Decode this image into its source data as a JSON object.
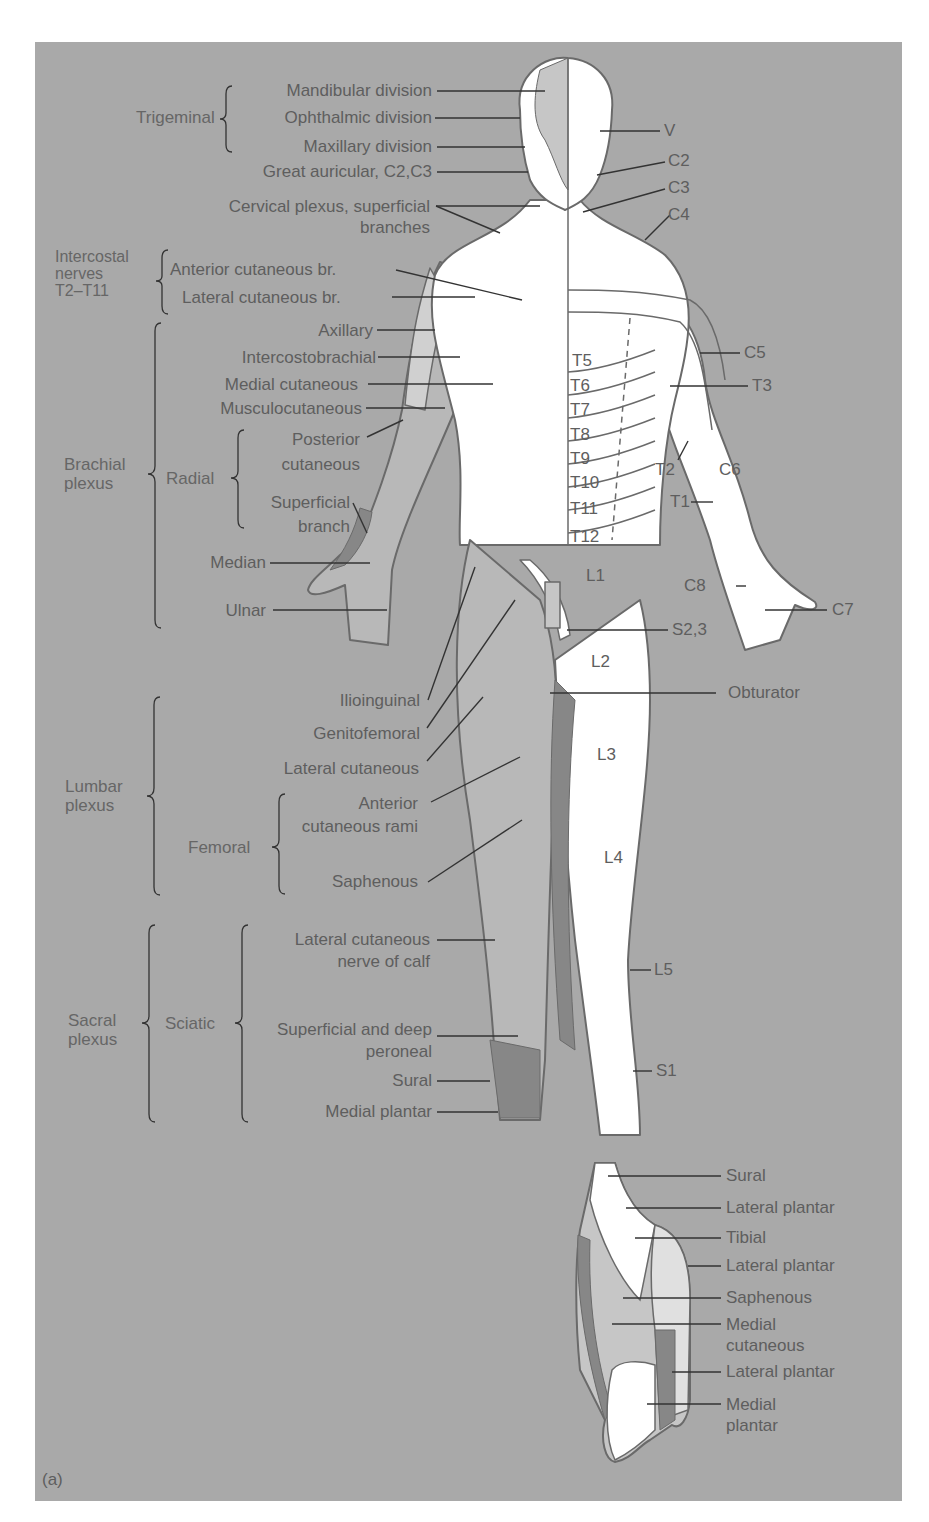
{
  "figure": {
    "panel_label": "(a)",
    "colors": {
      "background": "#a9a9a9",
      "body": "#ffffff",
      "outline": "#6a6a6a",
      "light_region": "#d0d0d0",
      "mid_region": "#b8b8b8",
      "dark_region": "#878787",
      "text": "#5e5e5e"
    }
  },
  "left_groups": {
    "trigeminal": {
      "name": "Trigeminal",
      "items": [
        "Mandibular division",
        "Ophthalmic division",
        "Maxillary division"
      ]
    },
    "great_auricular": "Great auricular, C2,C3",
    "cervical_plexus": "Cervical plexus, superficial branches",
    "intercostal": {
      "name": "Intercostal nerves T2–T11",
      "name_lines": [
        "Intercostal",
        "nerves",
        "T2–T11"
      ],
      "items": [
        "Anterior cutaneous br.",
        "Lateral cutaneous br."
      ]
    },
    "brachial": {
      "name_lines": [
        "Brachial",
        "plexus"
      ],
      "items": [
        "Axillary",
        "Intercostobrachial",
        "Medial cutaneous",
        "Musculocutaneous"
      ],
      "radial": {
        "name": "Radial",
        "items": [
          "Posterior cutaneous",
          "Superficial branch"
        ]
      },
      "more": [
        "Median",
        "Ulnar"
      ]
    },
    "lumbar": {
      "name_lines": [
        "Lumbar",
        "plexus"
      ],
      "items": [
        "Ilioinguinal",
        "Genitofemoral",
        "Lateral cutaneous"
      ],
      "femoral": {
        "name": "Femoral",
        "items": [
          "Anterior cutaneous rami",
          "Saphenous"
        ]
      }
    },
    "sacral": {
      "name_lines": [
        "Sacral",
        "plexus"
      ],
      "sciatic": {
        "name": "Sciatic",
        "items": [
          "Lateral cutaneous nerve of calf",
          "Superficial and deep peroneal",
          "Sural",
          "Medial plantar"
        ]
      }
    }
  },
  "right_labels": {
    "V": "V",
    "C2": "C2",
    "C3": "C3",
    "C4": "C4",
    "C5": "C5",
    "T3": "T3",
    "T2": "T2",
    "C6": "C6",
    "T1": "T1",
    "C8": "C8",
    "C7": "C7",
    "S23": "S2,3",
    "obturator": "Obturator",
    "L5": "L5",
    "S1": "S1"
  },
  "body_labels": {
    "thoracic": [
      "T5",
      "T6",
      "T7",
      "T8",
      "T9",
      "T10",
      "T11",
      "T12"
    ],
    "L1": "L1",
    "L2": "L2",
    "L3": "L3",
    "L4": "L4"
  },
  "foot_labels": [
    "Sural",
    "Lateral plantar",
    "Tibial",
    "Lateral plantar",
    "Saphenous",
    "Medial cutaneous",
    "Lateral plantar",
    "Medial plantar"
  ]
}
